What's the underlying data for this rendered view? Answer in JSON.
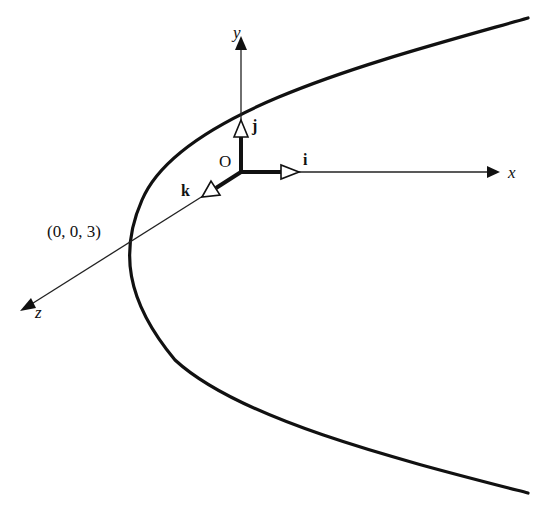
{
  "figure": {
    "axes": {
      "x": {
        "label": "x"
      },
      "y": {
        "label": "y"
      },
      "z": {
        "label": "z"
      }
    },
    "origin": {
      "label": "O"
    },
    "unit_vectors": {
      "i": {
        "label": "i"
      },
      "j": {
        "label": "j"
      },
      "k": {
        "label": "k"
      }
    },
    "point": {
      "label": "(0, 0, 3)"
    },
    "colors": {
      "ink": "#111111",
      "background": "#ffffff"
    }
  }
}
